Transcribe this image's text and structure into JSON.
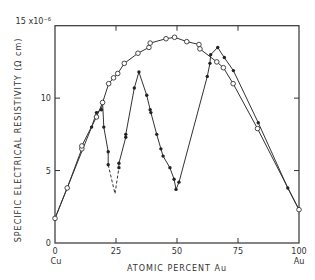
{
  "chart_data": {
    "type": "line",
    "title": "",
    "xlabel": "ATOMIC PERCENT Au",
    "ylabel": "SPECIFIC ELECTRICAL RESISTIVITY (Ω cm)",
    "y_multiplier_label": "15 x10⁻⁶",
    "xlim": [
      0,
      100
    ],
    "ylim": [
      0,
      15
    ],
    "x_ticks": [
      0,
      25,
      50,
      75,
      100
    ],
    "x_tick_labels": [
      "0",
      "25",
      "50",
      "75",
      "100"
    ],
    "x_end_labels": {
      "left": "Cu",
      "right": "Au"
    },
    "y_ticks": [
      0,
      5,
      10,
      15
    ],
    "y_tick_labels": [
      "0",
      "5",
      "10",
      "15 x10⁻⁶"
    ],
    "grid": false,
    "legend": null,
    "series": [
      {
        "name": "disordered (open circles)",
        "marker": "open-circle",
        "points": [
          [
            0,
            1.7
          ],
          [
            5,
            3.8
          ],
          [
            11,
            6.5
          ],
          [
            11,
            6.7
          ],
          [
            17,
            8.7
          ],
          [
            19.5,
            9.7
          ],
          [
            22,
            11.0
          ],
          [
            24,
            11.4
          ],
          [
            25.7,
            11.7
          ],
          [
            28.4,
            12.4
          ],
          [
            34,
            13.1
          ],
          [
            38.5,
            13.5
          ],
          [
            39,
            13.8
          ],
          [
            45.5,
            14.1
          ],
          [
            49,
            14.2
          ],
          [
            54,
            13.9
          ],
          [
            59,
            13.7
          ],
          [
            59.4,
            13.4
          ],
          [
            66.3,
            12.5
          ],
          [
            69,
            12.1
          ],
          [
            73,
            11.0
          ],
          [
            83,
            7.9
          ],
          [
            100,
            2.3
          ]
        ]
      },
      {
        "name": "ordered (filled circles)",
        "marker": "filled-circle",
        "segments": [
          {
            "style": "solid",
            "points": [
              [
                0,
                1.7
              ],
              [
                15,
                8.0
              ],
              [
                17,
                9.0
              ],
              [
                19,
                9.2
              ],
              [
                19.5,
                9.7
              ],
              [
                20,
                8.0
              ],
              [
                21.8,
                6.3
              ],
              [
                21.8,
                5.4
              ]
            ]
          },
          {
            "style": "dashed",
            "points": [
              [
                21.8,
                5.4
              ],
              [
                24.6,
                3.4
              ],
              [
                26.2,
                5.2
              ]
            ]
          },
          {
            "style": "solid",
            "points": [
              [
                26.2,
                5.2
              ],
              [
                26.2,
                5.5
              ],
              [
                29,
                7.3
              ],
              [
                29,
                7.5
              ],
              [
                32.5,
                10.7
              ],
              [
                34.4,
                11.8
              ],
              [
                37.6,
                10.2
              ],
              [
                39,
                9.2
              ],
              [
                39.3,
                9.0
              ],
              [
                41.7,
                7.5
              ],
              [
                43.4,
                6.5
              ],
              [
                44.3,
                6.0
              ],
              [
                47.1,
                5.2
              ],
              [
                48.8,
                4.4
              ],
              [
                49.6,
                3.7
              ],
              [
                50.8,
                4.2
              ],
              [
                62.4,
                11.5
              ],
              [
                63.5,
                12.4
              ],
              [
                63.8,
                13.0
              ],
              [
                66.7,
                13.5
              ],
              [
                69.4,
                12.8
              ],
              [
                73.1,
                11.9
              ],
              [
                83.3,
                8.3
              ],
              [
                95.4,
                3.8
              ],
              [
                100,
                2.3
              ]
            ]
          }
        ]
      }
    ]
  }
}
